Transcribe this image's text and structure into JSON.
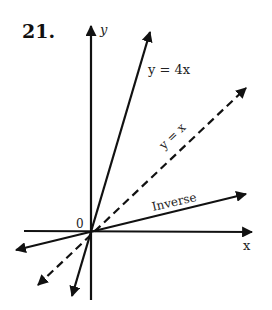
{
  "problem_number": "21.",
  "axes": {
    "x_label": "x",
    "y_label": "y",
    "origin_label": "0"
  },
  "lines": [
    {
      "name": "y = 4x",
      "label": "y = 4x",
      "style": "solid"
    },
    {
      "name": "y = x",
      "label": "y = x",
      "style": "dashed"
    },
    {
      "name": "inverse",
      "label": "Inverse",
      "style": "solid"
    }
  ],
  "colors": {
    "ink": "#111111",
    "background": "#ffffff"
  }
}
